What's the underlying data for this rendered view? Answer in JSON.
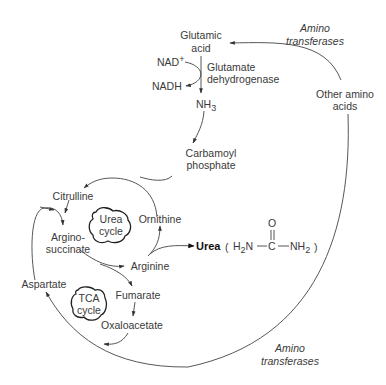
{
  "diagram": {
    "type": "metabolic-pathway",
    "nodes": {
      "glutamic_acid": [
        "Glutamic",
        "acid"
      ],
      "nad_plus": "NAD",
      "nad_plus_sup": "+",
      "nadh": "NADH",
      "glutamate_dehydrogenase": [
        "Glutamate",
        "dehydrogenase"
      ],
      "nh3": "NH",
      "nh3_sub": "3",
      "carbamoyl_phosphate": [
        "Carbamoyl",
        "phosphate"
      ],
      "citrulline": "Citrulline",
      "argininosuccinate": [
        "Argino-",
        "succinate"
      ],
      "ornithine": "Ornithine",
      "arginine": "Arginine",
      "urea": "Urea",
      "urea_formula": {
        "left": "H",
        "left_sub": "2",
        "left_n": "N",
        "carbon": "C",
        "oxygen": "O",
        "right": "NH",
        "right_sub": "2"
      },
      "urea_cycle": [
        "Urea",
        "cycle"
      ],
      "tca_cycle": [
        "TCA",
        "cycle"
      ],
      "fumarate": "Fumarate",
      "oxaloacetate": "Oxaloacetate",
      "aspartate": "Aspartate",
      "other_amino_acids": [
        "Other amino",
        "acids"
      ],
      "amino_transferases_top": [
        "Amino",
        "transferases"
      ],
      "amino_transferases_bottom": [
        "Amino",
        "transferases"
      ]
    },
    "edges": [
      {
        "from": "Other amino acids",
        "to": "Glutamic acid",
        "label": "Amino transferases"
      },
      {
        "from": "Glutamic acid",
        "to": "NH3",
        "label": "Glutamate dehydrogenase"
      },
      {
        "from": "NAD+",
        "to": "NADH"
      },
      {
        "from": "NH3",
        "to": "Carbamoyl phosphate"
      },
      {
        "from": "Carbamoyl phosphate",
        "to": "Citrulline"
      },
      {
        "from": "Ornithine",
        "to": "Citrulline"
      },
      {
        "from": "Citrulline",
        "to": "Argininosuccinate"
      },
      {
        "from": "Aspartate",
        "to": "Argininosuccinate"
      },
      {
        "from": "Argininosuccinate",
        "to": "Arginine"
      },
      {
        "from": "Argininosuccinate",
        "to": "Fumarate"
      },
      {
        "from": "Arginine",
        "to": "Ornithine"
      },
      {
        "from": "Arginine",
        "to": "Urea"
      },
      {
        "from": "Fumarate",
        "to": "Oxaloacetate"
      },
      {
        "from": "Oxaloacetate",
        "to": "Aspartate"
      },
      {
        "from": "Other amino acids",
        "to": "Aspartate",
        "label": "Amino transferases"
      }
    ]
  }
}
